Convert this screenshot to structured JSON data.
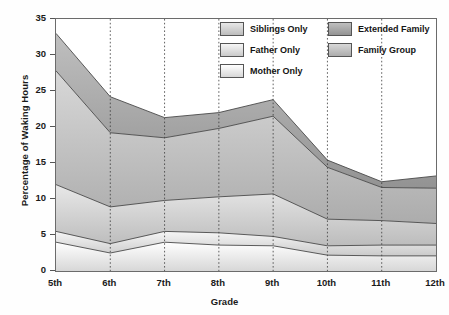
{
  "chart_data": {
    "type": "area",
    "title": "",
    "xlabel": "Grade",
    "ylabel": "Percentage of Waking Hours",
    "categories": [
      "5th",
      "6th",
      "7th",
      "8th",
      "9th",
      "10th",
      "11th",
      "12th"
    ],
    "ylim": [
      0,
      35
    ],
    "yticks": [
      0,
      5,
      10,
      15,
      20,
      25,
      30,
      35
    ],
    "stacked": true,
    "grid": "vertical-dotted",
    "legend_position": "top-right",
    "series": [
      {
        "name": "Mother Only",
        "values": [
          4.0,
          2.5,
          4.0,
          3.6,
          3.5,
          2.2,
          2.1,
          2.1
        ],
        "color": "#ededed"
      },
      {
        "name": "Father Only",
        "values": [
          1.5,
          1.3,
          1.5,
          1.7,
          1.3,
          1.3,
          1.5,
          1.5
        ],
        "color": "#e0e0e0"
      },
      {
        "name": "Siblings Only",
        "values": [
          6.5,
          5.1,
          4.3,
          5.0,
          5.9,
          3.7,
          3.4,
          3.0
        ],
        "color": "#d2d2d2"
      },
      {
        "name": "Family Group",
        "values": [
          15.8,
          10.3,
          8.7,
          9.5,
          10.8,
          7.2,
          4.6,
          4.9
        ],
        "color": "#c2c2c2"
      },
      {
        "name": "Extended Family",
        "values": [
          5.2,
          5.0,
          2.8,
          2.2,
          2.3,
          1.0,
          0.8,
          1.7
        ],
        "color": "#a9a9a9"
      }
    ],
    "cumulative_tops": {
      "Mother Only": [
        4.0,
        2.5,
        4.0,
        3.6,
        3.5,
        2.2,
        2.1,
        2.1
      ],
      "Father Only": [
        5.5,
        3.8,
        5.5,
        5.3,
        4.8,
        3.5,
        3.6,
        3.6
      ],
      "Siblings Only": [
        12.0,
        8.9,
        9.8,
        10.3,
        10.7,
        7.2,
        7.0,
        6.6
      ],
      "Family Group": [
        27.8,
        19.2,
        18.5,
        19.8,
        21.5,
        14.4,
        11.6,
        11.5
      ],
      "Extended Family": [
        33.0,
        24.2,
        21.3,
        22.0,
        23.8,
        15.4,
        12.4,
        13.2
      ]
    }
  },
  "legend": {
    "column_left": [
      {
        "label": "Siblings Only"
      },
      {
        "label": "Father Only"
      },
      {
        "label": "Mother Only"
      }
    ],
    "column_right": [
      {
        "label": "Extended Family"
      },
      {
        "label": "Family Group"
      }
    ]
  },
  "axes": {
    "y_title": "Percentage of Waking Hours",
    "x_title": "Grade",
    "y_ticks": [
      "0",
      "5",
      "10",
      "15",
      "20",
      "25",
      "30",
      "35"
    ],
    "x_ticks": [
      "5th",
      "6th",
      "7th",
      "8th",
      "9th",
      "10th",
      "11th",
      "12th"
    ]
  }
}
